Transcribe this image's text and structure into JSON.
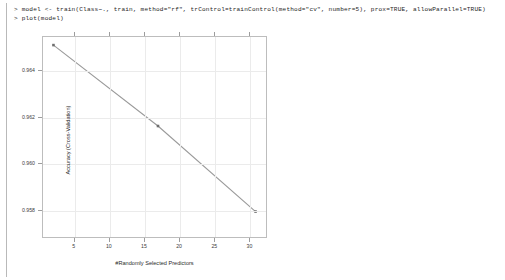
{
  "console": {
    "line1": "> model <- train(Class~., train, method=\"rf\", trControl=trainControl(method=\"cv\", number=5), prox=TRUE, allowParallel=TRUE)",
    "line2": "> plot(model)"
  },
  "chart_data": {
    "type": "line",
    "title": "",
    "xlabel": "#Randomly Selected Predictors",
    "ylabel": "Accuracy (Cross-Validation)",
    "x": [
      2,
      17,
      31
    ],
    "values": [
      0.9651,
      0.9616,
      0.9579
    ],
    "series": [
      {
        "name": "Accuracy (Cross-Validation)",
        "values": [
          0.9651,
          0.9616,
          0.9579
        ]
      }
    ],
    "xticks": [
      5,
      10,
      15,
      20,
      25,
      30
    ],
    "xtick_labels": [
      "5",
      "10",
      "15",
      "20",
      "25",
      "30"
    ],
    "yticks": [
      0.958,
      0.96,
      0.962,
      0.964
    ],
    "ytick_labels": [
      "0.958",
      "0.960",
      "0.962",
      "0.964"
    ],
    "xlim": [
      0.5,
      32.5
    ],
    "ylim": [
      0.9568,
      0.96545
    ],
    "grid": true,
    "legend": "none",
    "line_color": "#9a9a9a",
    "point_color": "#6e6e6e",
    "panel_border_color": "#bdbdbd",
    "grid_color": "#ebebeb"
  }
}
